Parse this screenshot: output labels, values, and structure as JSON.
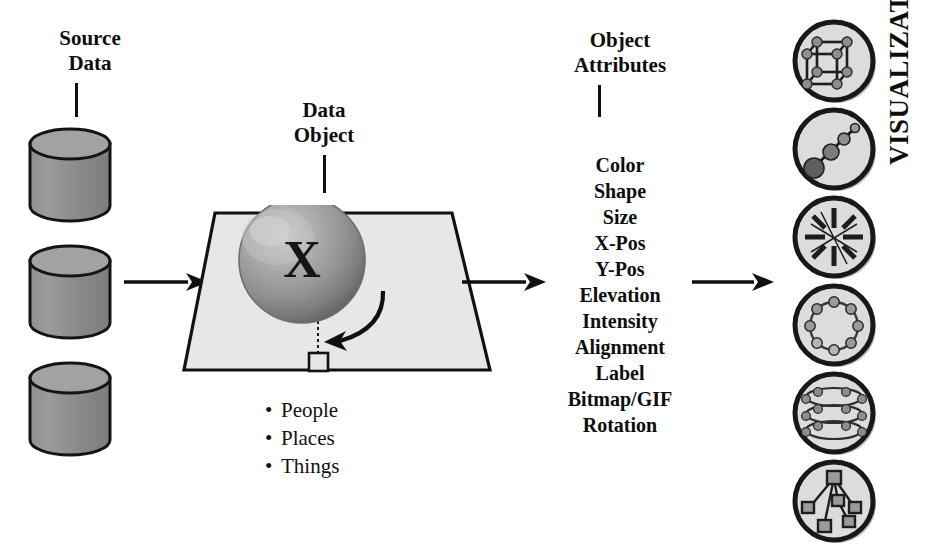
{
  "diagram": {
    "title_flow": "Source Data to Visualization pipeline",
    "source": {
      "label_line1": "Source",
      "label_line2": "Data",
      "cylinder_count": 3,
      "cylinder_name": "database-cylinder"
    },
    "data_object": {
      "label_line1": "Data",
      "label_line2": "Object",
      "sphere_letter": "X",
      "categories": [
        {
          "bullet": "•",
          "label": "People"
        },
        {
          "bullet": "•",
          "label": "Places"
        },
        {
          "bullet": "•",
          "label": "Things"
        }
      ]
    },
    "attributes": {
      "heading_line1": "Object",
      "heading_line2": "Attributes",
      "items": [
        "Color",
        "Shape",
        "Size",
        "X-Pos",
        "Y-Pos",
        "Elevation",
        "Intensity",
        "Alignment",
        "Label",
        "Bitmap/GIF",
        "Rotation"
      ]
    },
    "visualization": {
      "label": "VISUALIZATION",
      "icons": [
        {
          "name": "cube-lattice-icon",
          "desc": "3D cube wireframe with sphere nodes"
        },
        {
          "name": "sphere-chain-icon",
          "desc": "chain of spheres increasing in size"
        },
        {
          "name": "radial-starburst-icon",
          "desc": "radial spokes starburst"
        },
        {
          "name": "sphere-ring-icon",
          "desc": "ring of spheres"
        },
        {
          "name": "stacked-rings-icon",
          "desc": "stacked rings with nodes"
        },
        {
          "name": "hierarchy-tree-icon",
          "desc": "tree of square nodes"
        }
      ]
    },
    "arrows": [
      {
        "name": "arrow-source-to-object"
      },
      {
        "name": "arrow-object-to-attributes"
      },
      {
        "name": "arrow-attributes-to-visualization"
      }
    ]
  },
  "colors": {
    "ink": "#0d0d0d",
    "cylinder_fill": "#8a8a8a",
    "cylinder_top": "#9e9e9e",
    "plane_fill": "#e6e6e6",
    "plane_edge": "#111111",
    "sphere_mid": "#9a9a9a",
    "sphere_dark": "#6e6e6e",
    "sphere_light": "#c9c9c9",
    "disc_fill": "#d8d8d8",
    "disc_ring": "#1a1a1a",
    "node_fill": "#8d8d8d",
    "shadow": "#b9b9b9"
  }
}
